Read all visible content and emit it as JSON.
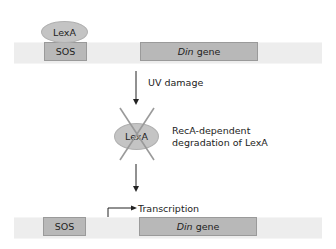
{
  "top": {
    "repressor_label": "LexA",
    "sos_label": "SOS",
    "gene_italic": "Din",
    "gene_rest": " gene"
  },
  "step1": {
    "label": "UV damage"
  },
  "step2": {
    "repressor_label": "LexA",
    "line1": "RecA-dependent",
    "line2": "degradation of LexA"
  },
  "bottom": {
    "sos_label": "SOS",
    "gene_italic": "Din",
    "gene_rest": " gene",
    "transcription_label": "Transcription"
  },
  "colors": {
    "dna": "#ededed",
    "box": "#b8b8b8",
    "repressor": "#c4c4c4",
    "cross": "#9a9a9a"
  }
}
